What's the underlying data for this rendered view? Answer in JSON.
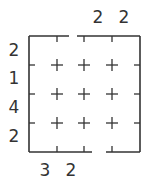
{
  "puzzle": {
    "grid_size": 4,
    "top_clues": [
      "",
      "",
      "2",
      "2"
    ],
    "bottom_clues": [
      "3",
      "2",
      "",
      ""
    ],
    "left_clues": [
      "2",
      "1",
      "4",
      "2"
    ],
    "right_clues": [
      "",
      "",
      "",
      ""
    ],
    "entrances": {
      "top_gap_column": 2,
      "bottom_gap_column": 3
    },
    "line_color": "#333333"
  }
}
